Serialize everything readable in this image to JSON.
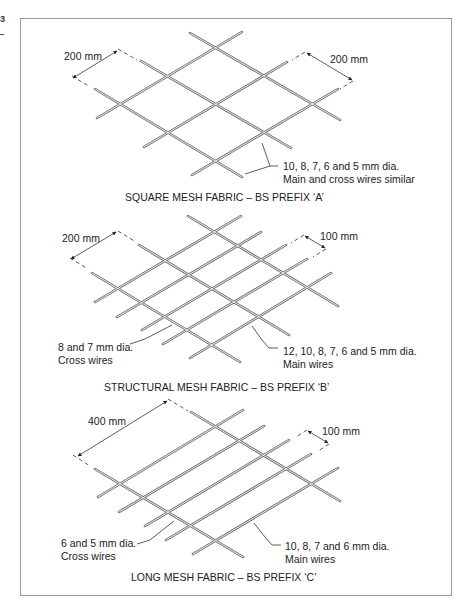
{
  "figure": {
    "page_marker": "3",
    "panels": [
      {
        "id": "A",
        "caption": "SQUARE MESH FABRIC – BS PREFIX ‘A’",
        "dim_left": "200 mm",
        "dim_right": "200 mm",
        "note_line1": "10, 8, 7, 6 and 5 mm dia.",
        "note_line2": "Main and cross wires similar"
      },
      {
        "id": "B",
        "caption": "STRUCTURAL MESH FABRIC – BS PREFIX ‘B’",
        "dim_left": "200 mm",
        "dim_right": "100 mm",
        "cross_note_line1": "8 and 7 mm dia.",
        "cross_note_line2": "Cross wires",
        "main_note_line1": "12, 10, 8, 7, 6 and 5 mm dia.",
        "main_note_line2": "Main wires"
      },
      {
        "id": "C",
        "caption": "LONG MESH FABRIC – BS PREFIX ‘C’",
        "dim_left": "400 mm",
        "dim_right": "100 mm",
        "cross_note_line1": "6 and 5 mm dia.",
        "cross_note_line2": "Cross wires",
        "main_note_line1": "10, 8, 7 and 6 mm dia.",
        "main_note_line2": "Main wires"
      }
    ]
  },
  "colors": {
    "wire": "#6a6a6a",
    "frame": "#9a9a9a",
    "text": "#222222"
  }
}
